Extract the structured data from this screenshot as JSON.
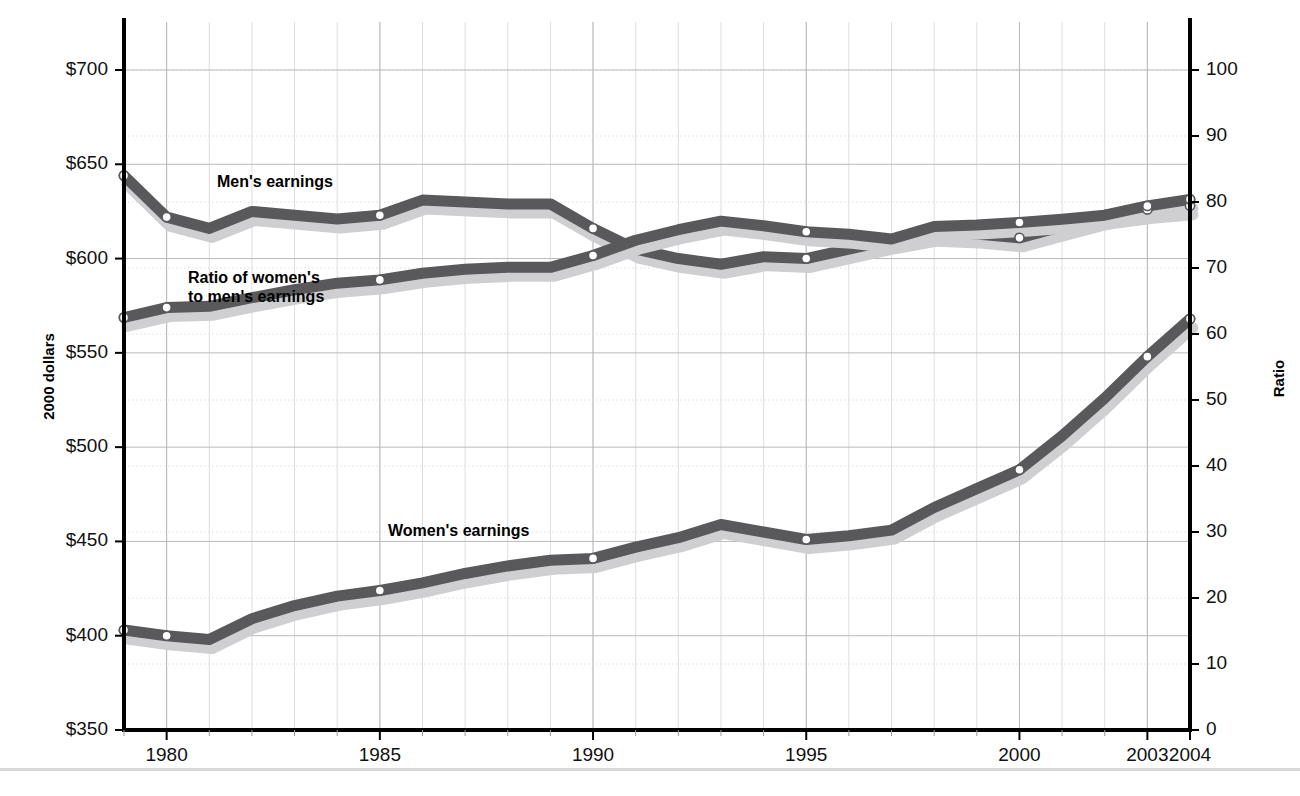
{
  "chart_data": {
    "type": "line",
    "title": "",
    "subtitle": "",
    "xlabel": "",
    "ylabel": "2000 dollars",
    "ylabel_right": "Ratio",
    "xlim": [
      1979,
      2004
    ],
    "ylim": [
      350,
      715
    ],
    "ylim_right": [
      0,
      104
    ],
    "grid": true,
    "legend_position": "inline-annotations",
    "yticks": [
      "$350",
      "$400",
      "$450",
      "$500",
      "$550",
      "$600",
      "$650",
      "$700"
    ],
    "ytick_values": [
      350,
      400,
      450,
      500,
      550,
      600,
      650,
      700
    ],
    "yticks_right": [
      "0",
      "10",
      "20",
      "30",
      "40",
      "50",
      "60",
      "70",
      "80",
      "90",
      "100"
    ],
    "ytick_values_right": [
      0,
      10,
      20,
      30,
      40,
      50,
      60,
      70,
      80,
      90,
      100
    ],
    "xticks": [
      "1980",
      "1985",
      "1990",
      "1995",
      "2000",
      "2003",
      "2004"
    ],
    "xtick_values": [
      1980,
      1985,
      1990,
      1995,
      2000,
      2003,
      2004
    ],
    "x": [
      1979,
      1980,
      1981,
      1982,
      1983,
      1984,
      1985,
      1986,
      1987,
      1988,
      1989,
      1990,
      1991,
      1992,
      1993,
      1994,
      1995,
      1996,
      1997,
      1998,
      1999,
      2000,
      2001,
      2002,
      2003,
      2004
    ],
    "series": [
      {
        "name": "Men's earnings",
        "axis": "left",
        "color": "#59595b",
        "shadow_color": "#cfcfd1",
        "marker_years": [
          1979,
          1980,
          1985,
          1990,
          1995,
          2000,
          2003,
          2004
        ],
        "values": [
          644,
          622,
          616,
          625,
          623,
          621,
          623,
          631,
          630,
          629,
          629,
          616,
          605,
          600,
          597,
          601,
          600,
          605,
          610,
          614,
          613,
          611,
          617,
          623,
          626,
          628
        ]
      },
      {
        "name": "Ratio of women's\nto men's earnings",
        "axis": "right",
        "color": "#59595b",
        "shadow_color": "#cfcfd1",
        "marker_years": [
          1979,
          1980,
          1985,
          1990,
          1995,
          2000,
          2003,
          2004
        ],
        "values": [
          62.5,
          64.0,
          64.2,
          65.5,
          66.7,
          67.7,
          68.2,
          69.2,
          69.8,
          70.1,
          70.1,
          71.9,
          74.2,
          75.8,
          77.1,
          76.4,
          75.5,
          75.1,
          74.4,
          76.3,
          76.5,
          76.9,
          77.4,
          78.0,
          79.4,
          80.4
        ]
      },
      {
        "name": "Women's earnings",
        "axis": "left",
        "color": "#59595b",
        "shadow_color": "#cfcfd1",
        "marker_years": [
          1979,
          1980,
          1985,
          1990,
          1995,
          2000,
          2003,
          2004
        ],
        "values": [
          403,
          400,
          398,
          409,
          416,
          421,
          424,
          428,
          433,
          437,
          440,
          441,
          447,
          452,
          459,
          455,
          451,
          453,
          456,
          468,
          478,
          488,
          506,
          526,
          548,
          568
        ]
      }
    ],
    "annotations": [
      {
        "text": "Men's earnings",
        "x_px": 217,
        "y_px": 172
      },
      {
        "text": "Ratio of women's",
        "x_px": 188,
        "y_px": 268
      },
      {
        "text": "to men's earnings",
        "x_px": 188,
        "y_px": 287
      },
      {
        "text": "Women's earnings",
        "x_px": 388,
        "y_px": 521
      }
    ]
  },
  "axis": {
    "left_title": "2000 dollars",
    "right_title": "Ratio"
  },
  "colors": {
    "line": "#59595b",
    "shadow": "#cfcfd1",
    "axis": "#000000",
    "grid_major": "#b9b9b9",
    "grid_minor": "#dedede",
    "marker_fill": "#ffffff"
  }
}
